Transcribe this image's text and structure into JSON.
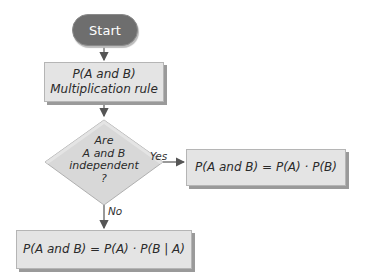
{
  "diagram": {
    "type": "flowchart",
    "nodes": {
      "start": {
        "shape": "terminator",
        "label": "Start"
      },
      "rule": {
        "shape": "process",
        "line1": "P(A and B)",
        "line2": "Multiplication rule"
      },
      "decision": {
        "shape": "decision",
        "line1": "Are",
        "line2": "A and B",
        "line3": "independent",
        "line4": "?"
      },
      "independent": {
        "shape": "process",
        "label": "P(A and B) = P(A) · P(B)"
      },
      "dependent": {
        "shape": "process",
        "label": "P(A and B) = P(A) · P(B | A)"
      }
    },
    "edges": {
      "yes_label": "Yes",
      "no_label": "No"
    },
    "colors": {
      "terminator_fill": "#6e6e6e",
      "process_fill": "#e4e4e4",
      "decision_fill": "#d8d8d8",
      "arrow": "#555555"
    }
  }
}
